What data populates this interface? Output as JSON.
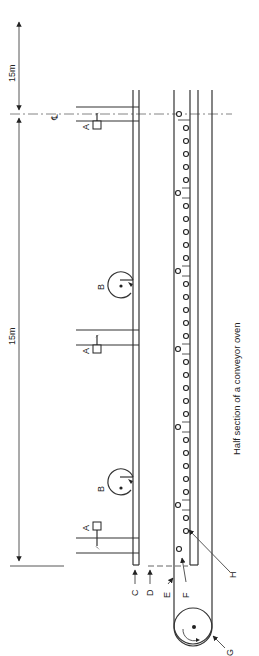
{
  "figure": {
    "caption": "Half section of a conveyor oven",
    "orientation": "rotated 90 degrees counter-clockwise",
    "dimensions": {
      "top_span": "15m",
      "main_span": "15m"
    },
    "centerline_symbol": "℄",
    "labels": {
      "A": "A",
      "B": "B",
      "C": "C",
      "D": "D",
      "E": "E",
      "F": "F",
      "G": "G",
      "H": "H"
    },
    "components": [
      {
        "label": "A",
        "description": "damper / hanger unit",
        "count": 3
      },
      {
        "label": "B",
        "description": "circulation fan",
        "count": 2
      },
      {
        "label": "C",
        "description": "outer wall"
      },
      {
        "label": "D",
        "description": "inner wall (dashed)"
      },
      {
        "label": "E",
        "description": "conveyor belt"
      },
      {
        "label": "F",
        "description": "product on belt"
      },
      {
        "label": "G",
        "description": "drive drum"
      },
      {
        "label": "H",
        "description": "support rollers"
      }
    ]
  }
}
